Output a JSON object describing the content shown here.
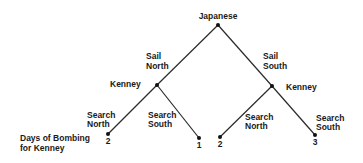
{
  "diagram": {
    "type": "game-tree",
    "root": {
      "player": "Japanese",
      "x": 218,
      "y": 25
    },
    "moves": {
      "left": [
        "Sail",
        "North"
      ],
      "right": [
        "Sail",
        "South"
      ]
    },
    "decision_nodes": [
      {
        "player": "Kenney",
        "x": 157,
        "y": 85
      },
      {
        "player": "Kenney",
        "x": 272,
        "y": 86
      }
    ],
    "sub_moves": [
      {
        "lines": [
          "Search",
          "North"
        ]
      },
      {
        "lines": [
          "Search",
          "South"
        ]
      },
      {
        "lines": [
          "Search",
          "North"
        ]
      },
      {
        "lines": [
          "Search",
          "South"
        ]
      }
    ],
    "leaves": [
      {
        "payoff": "2",
        "x": 108,
        "y": 134
      },
      {
        "payoff": "1",
        "x": 199,
        "y": 138
      },
      {
        "payoff": "2",
        "x": 220,
        "y": 137
      },
      {
        "payoff": "3",
        "x": 315,
        "y": 135
      }
    ],
    "payoff_label": [
      "Days of Bombing",
      "for Kenney"
    ]
  }
}
